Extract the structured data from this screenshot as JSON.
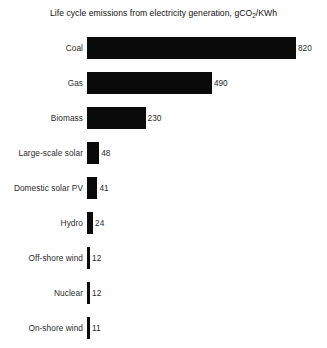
{
  "chart_data": {
    "type": "bar",
    "orientation": "horizontal",
    "title_prefix": "Life cycle emissions from electricity generation, gCO",
    "title_sub": "2",
    "title_suffix": "/KWh",
    "title": "Life cycle emissions from electricity generation, gCO2/KWh",
    "xlabel": "",
    "ylabel": "",
    "xlim": [
      0,
      820
    ],
    "grid": false,
    "legend": "none",
    "unit": "gCO2/KWh",
    "categories": [
      "Coal",
      "Gas",
      "Biomass",
      "Large-scale solar",
      "Domestic solar PV",
      "Hydro",
      "Off-shore wind",
      "Nuclear",
      "On-shore wind"
    ],
    "values": [
      820,
      490,
      230,
      48,
      41,
      24,
      12,
      12,
      11
    ],
    "bars": [
      {
        "label": "Coal",
        "value": 820,
        "value_label": "820"
      },
      {
        "label": "Gas",
        "value": 490,
        "value_label": "490"
      },
      {
        "label": "Biomass",
        "value": 230,
        "value_label": "230"
      },
      {
        "label": "Large-scale solar",
        "value": 48,
        "value_label": "48"
      },
      {
        "label": "Domestic solar PV",
        "value": 41,
        "value_label": "41"
      },
      {
        "label": "Hydro",
        "value": 24,
        "value_label": "24"
      },
      {
        "label": "Off-shore wind",
        "value": 12,
        "value_label": "12"
      },
      {
        "label": "Nuclear",
        "value": 12,
        "value_label": "12"
      },
      {
        "label": "On-shore wind",
        "value": 11,
        "value_label": "11"
      }
    ],
    "colors": {
      "bar": "#0a0a0a",
      "background": "#ffffff",
      "text": "#2b2b2b",
      "title": "#111111"
    }
  }
}
